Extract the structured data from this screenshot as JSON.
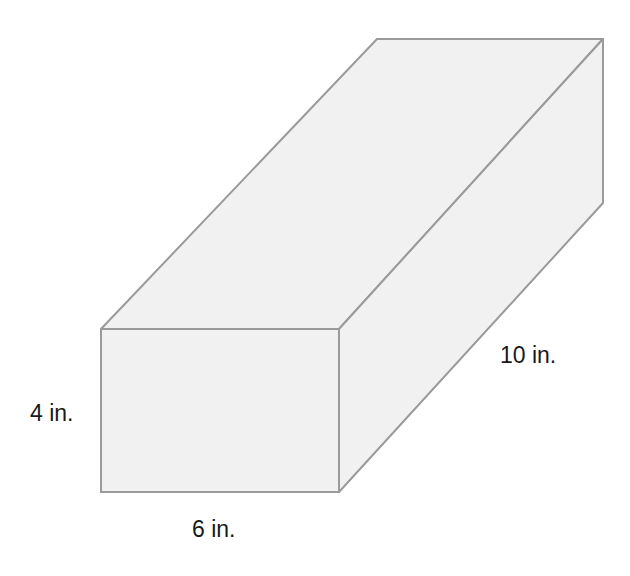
{
  "diagram": {
    "type": "rectangular-prism",
    "colors": {
      "face_fill": "#f1f1f1",
      "edge_stroke": "#9a9a9a",
      "label_text": "#1a1a1a"
    },
    "dimensions": {
      "height": {
        "value": 4,
        "unit": "in.",
        "label": "4 in."
      },
      "width": {
        "value": 6,
        "unit": "in.",
        "label": "6 in."
      },
      "length": {
        "value": 10,
        "unit": "in.",
        "label": "10 in."
      }
    }
  }
}
